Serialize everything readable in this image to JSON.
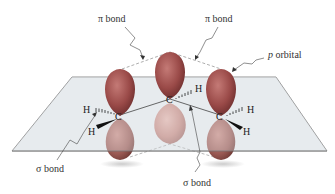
{
  "figure": {
    "labels": {
      "pi_bond_left": "π bond",
      "pi_bond_right": "π bond",
      "p_orbital_p": "p",
      "p_orbital_word": " orbital",
      "sigma_bond_left": "σ bond",
      "sigma_bond_center": "σ bond"
    },
    "atoms": {
      "carbon": "C",
      "hydrogen": "H"
    },
    "colors": {
      "lobe_top": "#9a4a4a",
      "lobe_bottom": "#c07a72",
      "plane_fill": "#e6ebee",
      "plane_stroke": "#777777",
      "text": "#333333"
    }
  }
}
